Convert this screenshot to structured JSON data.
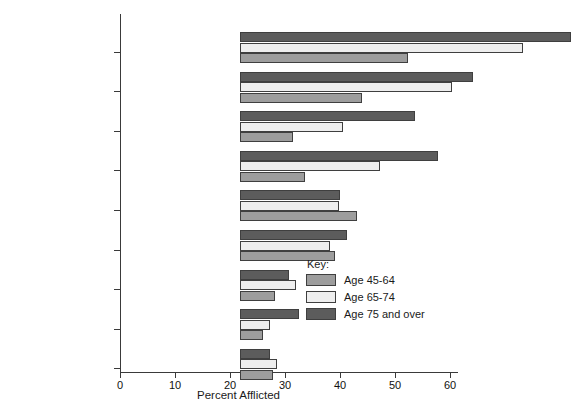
{
  "chart_data": {
    "type": "bar",
    "orientation": "horizontal",
    "title": "",
    "xlabel": "Percent Afflicted",
    "ylabel": "",
    "xlim": [
      0,
      60
    ],
    "xticks": [
      0,
      10,
      20,
      30,
      40,
      50,
      60
    ],
    "grid": false,
    "legend_title": "Key:",
    "legend_position": "inside-lower-right",
    "categories": [
      "Arthritis",
      "Hypertensive Disease",
      "Hearing Impairments",
      "Heart Conditions",
      "Chronic Sinusitis",
      "Deformities or\nOrthopedic Impairments",
      "Diabetes",
      "Visual Impairments",
      "Hemorrhoids"
    ],
    "series": [
      {
        "name": "Age 45-64",
        "color": "#9d9d9d",
        "values": [
          30.5,
          22.2,
          9.6,
          11.8,
          21.2,
          17.3,
          6.4,
          4.2,
          6.0
        ]
      },
      {
        "name": "Age 65-74",
        "color": "#eeeeee",
        "values": [
          51.5,
          38.5,
          18.7,
          25.5,
          18.0,
          16.4,
          10.2,
          5.5,
          6.7
        ]
      },
      {
        "name": "Age 75 and over",
        "color": "#5c5c5c",
        "values": [
          60.2,
          42.4,
          31.8,
          36.0,
          18.2,
          19.5,
          8.9,
          10.7,
          5.5
        ]
      }
    ]
  }
}
